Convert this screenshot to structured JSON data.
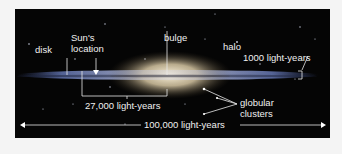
{
  "figure": {
    "labels": {
      "disk": "disk",
      "sun_location_line1": "Sun's",
      "sun_location_line2": "location",
      "bulge": "bulge",
      "halo": "halo",
      "thickness": "1000 light-years",
      "sun_distance": "27,000 light-years",
      "globular_line1": "globular",
      "globular_line2": "clusters",
      "diameter": "100,000 light-years"
    },
    "colors": {
      "background": "#050505",
      "page": "#f4f4f4",
      "text": "#f0f0f0",
      "disk": "#6f7fae",
      "bulge": "#e8dcc0"
    }
  }
}
